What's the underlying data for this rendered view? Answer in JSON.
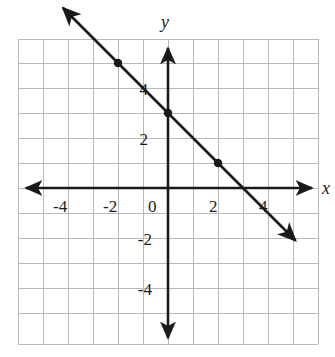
{
  "chart_data": {
    "type": "line",
    "title": "",
    "subtitle": "",
    "xlabel": "x",
    "ylabel": "y",
    "xlim": [
      -6,
      6
    ],
    "ylim": [
      -6,
      6
    ],
    "grid": true,
    "grid_step": 1,
    "legend": "none",
    "x_tick_labels": [
      "-4",
      "-2",
      "0",
      "2",
      "4"
    ],
    "x_tick_values": [
      -4,
      -2,
      0,
      2,
      4
    ],
    "y_tick_labels": [
      "4",
      "2",
      "-2",
      "-4"
    ],
    "y_tick_values": [
      4,
      2,
      -2,
      -4
    ],
    "origin_label": "0",
    "series": [
      {
        "name": "line",
        "equation": "y = -x + 3",
        "slope": -1,
        "y_intercept": 3,
        "x_intercept": 3,
        "line_from": [
          -4.2,
          7.2
        ],
        "line_to": [
          5.1,
          -2.1
        ],
        "arrow_start": true,
        "arrow_end": true,
        "marked_points": [
          {
            "x": -2,
            "y": 5
          },
          {
            "x": 0,
            "y": 3
          },
          {
            "x": 2,
            "y": 1
          }
        ]
      }
    ]
  },
  "style": {
    "axis_color": "#1a1a1a",
    "grid_color": "#b9b9bd",
    "line_color": "#1a1a1a",
    "point_color": "#1a1a1a",
    "background": "#ffffff"
  },
  "geometry": {
    "origin_px": [
      168,
      188
    ],
    "unit_px": 25,
    "grid_left": 17,
    "grid_top": 39,
    "grid_right": 319,
    "grid_bottom": 344
  }
}
